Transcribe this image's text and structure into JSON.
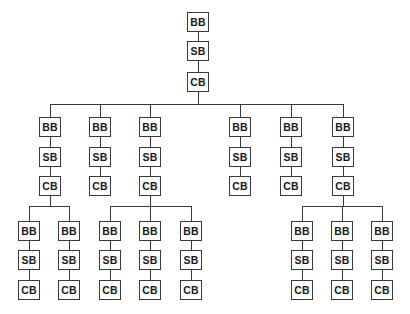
{
  "diagram": {
    "type": "tree",
    "line_color": "#3a3a3a",
    "node_labels": [
      "BB",
      "SB",
      "CB"
    ],
    "root": {
      "chain": [
        "BB",
        "SB",
        "CB"
      ],
      "children": [
        {
          "chain": [
            "BB",
            "SB",
            "CB"
          ],
          "children": [
            {
              "chain": [
                "BB",
                "SB",
                "CB"
              ]
            },
            {
              "chain": [
                "BB",
                "SB",
                "CB"
              ]
            }
          ]
        },
        {
          "chain": [
            "BB",
            "SB",
            "CB"
          ]
        },
        {
          "chain": [
            "BB",
            "SB",
            "CB"
          ],
          "children": [
            {
              "chain": [
                "BB",
                "SB",
                "CB"
              ]
            },
            {
              "chain": [
                "BB",
                "SB",
                "CB"
              ]
            },
            {
              "chain": [
                "BB",
                "SB",
                "CB"
              ]
            }
          ]
        },
        {
          "chain": [
            "BB",
            "SB",
            "CB"
          ]
        },
        {
          "chain": [
            "BB",
            "SB",
            "CB"
          ]
        },
        {
          "chain": [
            "BB",
            "SB",
            "CB"
          ],
          "children": [
            {
              "chain": [
                "BB",
                "SB",
                "CB"
              ]
            },
            {
              "chain": [
                "BB",
                "SB",
                "CB"
              ]
            },
            {
              "chain": [
                "BB",
                "SB",
                "CB"
              ]
            }
          ]
        }
      ]
    }
  }
}
